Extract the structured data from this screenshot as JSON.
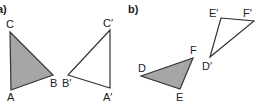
{
  "colors": {
    "fill": "#a6a6a6",
    "stroke": "#333333",
    "text": "#222222"
  },
  "parts": [
    {
      "label": "a)",
      "shaded_triangle": {
        "vertices": {
          "A": "A",
          "B": "B",
          "C": "C"
        }
      },
      "image_triangle": {
        "vertices": {
          "A": "A′",
          "B": "B′",
          "C": "C′"
        }
      }
    },
    {
      "label": "b)",
      "shaded_triangle": {
        "vertices": {
          "D": "D",
          "E": "E",
          "F": "F"
        }
      },
      "image_triangle": {
        "vertices": {
          "D": "D′",
          "E": "E′",
          "F": "F′"
        }
      }
    }
  ]
}
